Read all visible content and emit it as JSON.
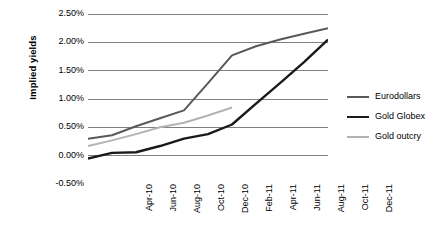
{
  "chart_data": {
    "type": "line",
    "title": "",
    "xlabel": "",
    "ylabel": "Implied yields",
    "ylim": [
      -0.005,
      0.025
    ],
    "y_ticks": [
      "-0.50%",
      "0.00%",
      "0.50%",
      "1.00%",
      "1.50%",
      "2.00%",
      "2.50%"
    ],
    "y_tick_values": [
      -0.5,
      0.0,
      0.5,
      1.0,
      1.5,
      2.0,
      2.5
    ],
    "y_unit": "percent",
    "grid": true,
    "legend_position": "right",
    "categories": [
      "Apr-10",
      "Jun-10",
      "Aug-10",
      "Oct-10",
      "Dec-10",
      "Feb-11",
      "Apr-11",
      "Jun-11",
      "Aug-11",
      "Oct-11",
      "Dec-11"
    ],
    "series": [
      {
        "name": "Eurodollars",
        "color": "#595959",
        "width": 2.0,
        "values": [
          0.3,
          0.36,
          0.52,
          0.66,
          0.8,
          1.28,
          1.77,
          1.93,
          2.05,
          2.15,
          2.25
        ]
      },
      {
        "name": "Gold Globex",
        "color": "#1a1a1a",
        "width": 2.4,
        "values": [
          -0.05,
          0.05,
          0.06,
          0.17,
          0.3,
          0.38,
          0.55,
          0.92,
          1.28,
          1.65,
          2.05
        ]
      },
      {
        "name": "Gold outcry",
        "color": "#b3b3b3",
        "width": 2.0,
        "values": [
          0.17,
          0.27,
          0.38,
          0.5,
          0.58,
          0.71,
          0.85,
          null,
          null,
          null,
          null
        ]
      }
    ]
  },
  "axes": {
    "grid_color": "#808080",
    "axis_color": "#595959"
  }
}
